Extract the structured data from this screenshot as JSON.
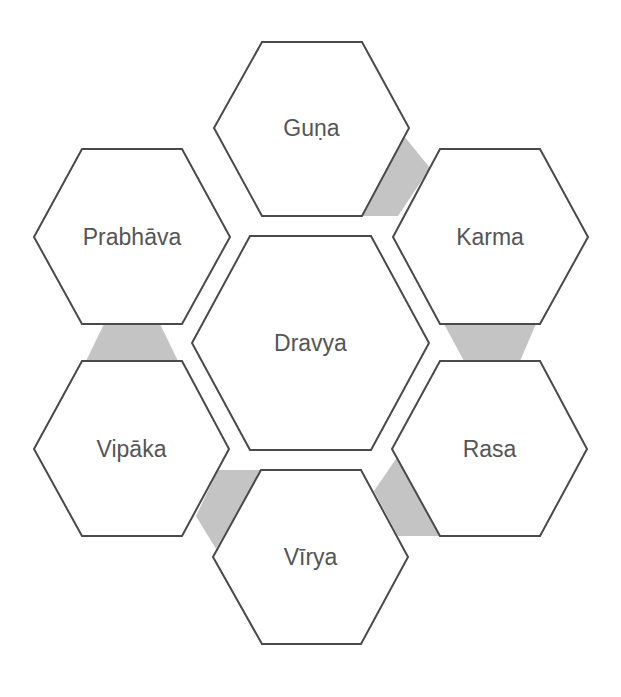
{
  "diagram": {
    "type": "hexagon-cluster",
    "center": {
      "id": "dravya",
      "label": "Dravya"
    },
    "nodes": [
      {
        "id": "guna",
        "label": "Guṇa"
      },
      {
        "id": "karma",
        "label": "Karma"
      },
      {
        "id": "rasa",
        "label": "Rasa"
      },
      {
        "id": "virya",
        "label": "Vīrya"
      },
      {
        "id": "vipaka",
        "label": "Vipāka"
      },
      {
        "id": "prabhava",
        "label": "Prabhāva"
      }
    ],
    "connections": [
      {
        "from": "guna",
        "to": "karma"
      },
      {
        "from": "karma",
        "to": "rasa"
      },
      {
        "from": "rasa",
        "to": "virya"
      },
      {
        "from": "virya",
        "to": "vipaka"
      },
      {
        "from": "vipaka",
        "to": "prabhava"
      }
    ],
    "colors": {
      "stroke": "#4a4a4a",
      "connector": "#c4c4c4",
      "text": "#555555",
      "fill": "#ffffff"
    }
  }
}
